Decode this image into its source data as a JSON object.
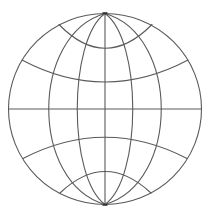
{
  "icon": {
    "name": "globe-icon",
    "stroke_color": "#5a5a5a",
    "background": "#ffffff",
    "meridian_count": 7,
    "latitude_count": 5
  }
}
